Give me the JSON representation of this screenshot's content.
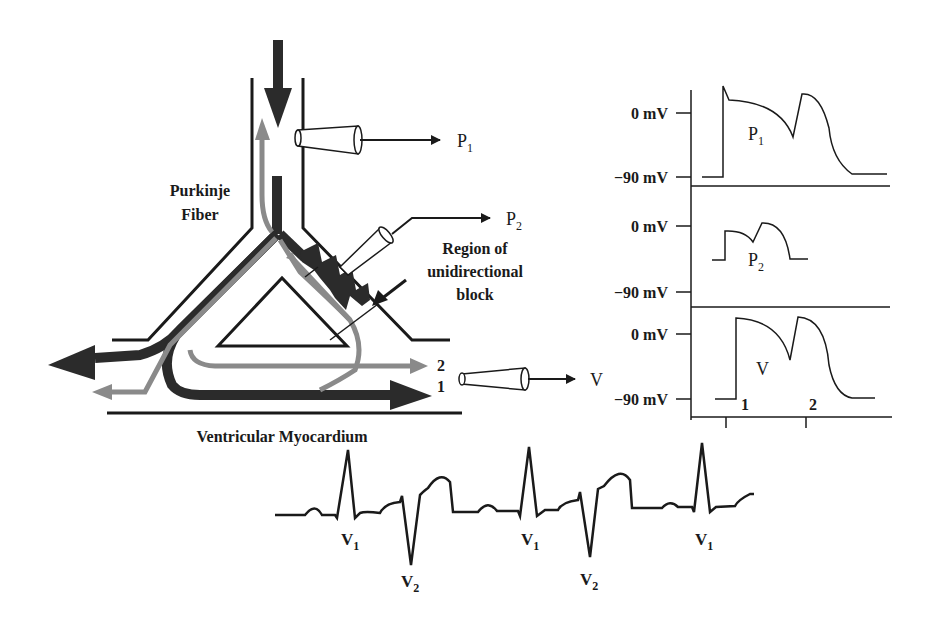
{
  "diagram": {
    "labels": {
      "purkinje_line1": "Purkinje",
      "purkinje_line2": "Fiber",
      "block_line1": "Region of",
      "block_line2": "unidirectional",
      "block_line3": "block",
      "myocardium": "Ventricular Myocardium",
      "path_2": "2",
      "path_1": "1"
    },
    "electrodes": [
      {
        "name": "P",
        "subscript": "1"
      },
      {
        "name": "P",
        "subscript": "2"
      },
      {
        "name": "V",
        "subscript": ""
      }
    ],
    "colors": {
      "dark_pathway": "#2b2b2b",
      "gray_pathway": "#8a8a8a",
      "line": "#1a1a1a"
    }
  },
  "traces": {
    "panels": [
      {
        "id": "P1",
        "label": "P",
        "sub": "1",
        "top_tick": "0 mV",
        "bottom_tick": "−90 mV"
      },
      {
        "id": "P2",
        "label": "P",
        "sub": "2",
        "top_tick": "0 mV",
        "bottom_tick": "−90 mV"
      },
      {
        "id": "V",
        "label": "V",
        "sub": "",
        "top_tick": "0 mV",
        "bottom_tick": "−90 mV",
        "markers": [
          "1",
          "2"
        ]
      }
    ]
  },
  "ecg": {
    "beat_labels": [
      {
        "name": "V",
        "sub": "1"
      },
      {
        "name": "V",
        "sub": "2"
      },
      {
        "name": "V",
        "sub": "1"
      },
      {
        "name": "V",
        "sub": "2"
      },
      {
        "name": "V",
        "sub": "1"
      }
    ]
  }
}
